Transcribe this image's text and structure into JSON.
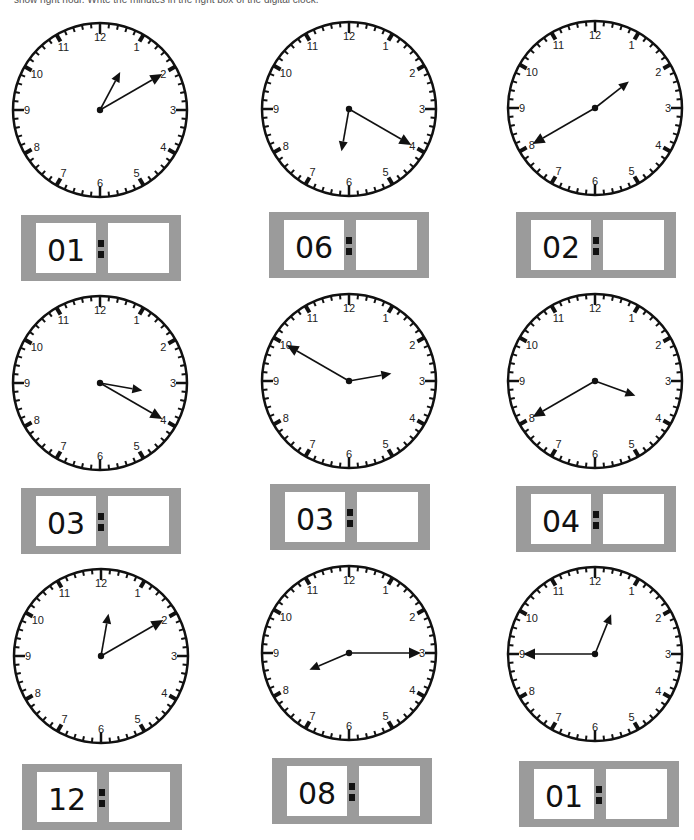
{
  "instructions": "show right hour. Write the minutes in the right box of the digital clock.",
  "clock_numbers": [
    "12",
    "1",
    "2",
    "3",
    "4",
    "5",
    "6",
    "7",
    "8",
    "9",
    "10",
    "11"
  ],
  "colors": {
    "face": "#ffffff",
    "ink": "#111111",
    "box": "#9b9b9b"
  },
  "exercises": [
    {
      "hour_label": "01",
      "minute_value": "",
      "hour_hand_deg": 28,
      "minute_hand_deg": 60,
      "clock": {
        "cx": 100,
        "cy": 110
      },
      "box": {
        "x": 21,
        "y": 215
      }
    },
    {
      "hour_label": "06",
      "minute_value": "",
      "hour_hand_deg": 190,
      "minute_hand_deg": 120,
      "clock": {
        "cx": 349,
        "cy": 109
      },
      "box": {
        "x": 269,
        "y": 212
      }
    },
    {
      "hour_label": "02",
      "minute_value": "",
      "hour_hand_deg": 52,
      "minute_hand_deg": 240,
      "clock": {
        "cx": 595,
        "cy": 108
      },
      "box": {
        "x": 516,
        "y": 212
      }
    },
    {
      "hour_label": "03",
      "minute_value": "",
      "hour_hand_deg": 100,
      "minute_hand_deg": 120,
      "clock": {
        "cx": 100,
        "cy": 383
      },
      "box": {
        "x": 21,
        "y": 488
      }
    },
    {
      "hour_label": "03",
      "minute_value": "",
      "hour_hand_deg": 80,
      "minute_hand_deg": 300,
      "clock": {
        "cx": 349,
        "cy": 381
      },
      "box": {
        "x": 270,
        "y": 484
      }
    },
    {
      "hour_label": "04",
      "minute_value": "",
      "hour_hand_deg": 110,
      "minute_hand_deg": 240,
      "clock": {
        "cx": 595,
        "cy": 381
      },
      "box": {
        "x": 516,
        "y": 486
      }
    },
    {
      "hour_label": "12",
      "minute_value": "",
      "hour_hand_deg": 10,
      "minute_hand_deg": 60,
      "clock": {
        "cx": 101,
        "cy": 656
      },
      "box": {
        "x": 22,
        "y": 764
      }
    },
    {
      "hour_label": "08",
      "minute_value": "",
      "hour_hand_deg": 247,
      "minute_hand_deg": 90,
      "clock": {
        "cx": 349,
        "cy": 653
      },
      "box": {
        "x": 272,
        "y": 758
      }
    },
    {
      "hour_label": "01",
      "minute_value": "",
      "hour_hand_deg": 22,
      "minute_hand_deg": 270,
      "clock": {
        "cx": 595,
        "cy": 654
      },
      "box": {
        "x": 519,
        "y": 761
      }
    }
  ]
}
